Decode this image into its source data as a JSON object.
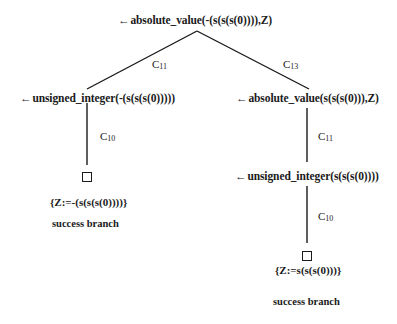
{
  "diagram": {
    "type": "sld-resolution-tree",
    "arrow_glyph": "←",
    "root": {
      "goal": "absolute_value(-(s(s(s(0)))),Z)"
    },
    "edges": [
      {
        "from": "root",
        "to": "left_1",
        "label_main": "C",
        "label_sub": "11"
      },
      {
        "from": "root",
        "to": "right_1",
        "label_main": "C",
        "label_sub": "13"
      },
      {
        "from": "left_1",
        "to": "left_leaf",
        "label_main": "C",
        "label_sub": "10"
      },
      {
        "from": "right_1",
        "to": "right_2",
        "label_main": "C",
        "label_sub": "11"
      },
      {
        "from": "right_2",
        "to": "right_leaf",
        "label_main": "C",
        "label_sub": "10"
      }
    ],
    "left_branch": {
      "goal_1": "unsigned_integer(-(s(s(s(0)))))",
      "leaf": {
        "symbol": "empty-clause-box",
        "substitution": "{Z:=-(s(s(s(0))))}",
        "status": "success branch"
      }
    },
    "right_branch": {
      "goal_1": "absolute_value(s(s(s(0))),Z)",
      "goal_2": "unsigned_integer(s(s(s(0))))",
      "leaf": {
        "symbol": "empty-clause-box",
        "substitution": "{Z:=s(s(s(0)))}",
        "status": "success branch"
      }
    }
  }
}
